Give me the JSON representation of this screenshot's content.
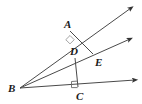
{
  "figure": {
    "background_color": "#ffffff",
    "stroke_color": "#4a4a4a",
    "label_color": "#1a1a1a",
    "width": 142,
    "height": 104
  },
  "labels": {
    "a": "A",
    "b": "B",
    "c": "C",
    "d": "D",
    "e": "E"
  },
  "points": {
    "A": {
      "x": 70,
      "y": 31
    },
    "B": {
      "x": 20,
      "y": 88
    },
    "C": {
      "x": 78,
      "y": 88
    },
    "D": {
      "x": 75,
      "y": 58
    },
    "E": {
      "x": 93,
      "y": 54
    }
  },
  "label_positions": {
    "A": {
      "x": 64,
      "y": 19
    },
    "B": {
      "x": 8,
      "y": 83
    },
    "C": {
      "x": 76,
      "y": 91
    },
    "D": {
      "x": 70,
      "y": 46
    },
    "E": {
      "x": 95,
      "y": 57
    }
  },
  "rays": [
    {
      "name": "ray-b-a",
      "from": "B",
      "through": "A",
      "tip_x": 134,
      "tip_y": 6
    },
    {
      "name": "ray-b-d-e",
      "from": "B",
      "through": "E",
      "tip_x": 133,
      "tip_y": 37
    },
    {
      "name": "ray-b-c",
      "from": "B",
      "through": "C",
      "tip_x": 138,
      "tip_y": 79
    }
  ],
  "segments": [
    {
      "name": "segment-a-e",
      "from": "A",
      "to": "E"
    },
    {
      "name": "segment-d-c",
      "from": "D",
      "to": "C"
    }
  ],
  "right_angles": [
    {
      "name": "right-angle-at-a",
      "vertex": "A",
      "style": "rotated-square"
    },
    {
      "name": "right-angle-at-c",
      "vertex": "C",
      "style": "square"
    }
  ]
}
